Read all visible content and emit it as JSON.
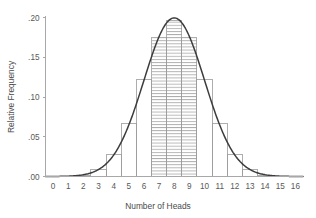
{
  "chart_data": {
    "type": "bar",
    "title": "",
    "subtitle": "",
    "xlabel": "Number of Heads",
    "ylabel": "Relative Frequency",
    "categories": [
      0,
      1,
      2,
      3,
      4,
      5,
      6,
      7,
      8,
      9,
      10,
      11,
      12,
      13,
      14,
      15,
      16
    ],
    "values": [
      0.0,
      0.0002,
      0.0018,
      0.0085,
      0.0278,
      0.0667,
      0.1222,
      0.1746,
      0.1964,
      0.1746,
      0.1222,
      0.0667,
      0.0278,
      0.0085,
      0.0018,
      0.0002,
      0.0
    ],
    "xlim": [
      -0.5,
      16.5
    ],
    "ylim": [
      0,
      0.2
    ],
    "xticks": [
      "0",
      "1",
      "2",
      "3",
      "4",
      "5",
      "6",
      "7",
      "8",
      "9",
      "10",
      "11",
      "12",
      "13",
      "14",
      "15",
      "16"
    ],
    "yticks": [
      ".00",
      ".05",
      ".10",
      ".15",
      ".20"
    ],
    "ytick_values": [
      0.0,
      0.05,
      0.1,
      0.15,
      0.2
    ],
    "grid": false,
    "legend": "none",
    "series": [
      {
        "name": "Relative frequency histogram",
        "type": "bar",
        "values": [
          0.0,
          0.0002,
          0.0018,
          0.0085,
          0.0278,
          0.0667,
          0.1222,
          0.1746,
          0.1964,
          0.1746,
          0.1222,
          0.0667,
          0.0278,
          0.0085,
          0.0018,
          0.0002,
          0.0
        ]
      },
      {
        "name": "Normal approximation curve",
        "type": "line",
        "mean": 8.0,
        "sd": 2.0,
        "peak": 0.1995
      }
    ],
    "highlighted_bars": [
      7,
      8,
      9
    ],
    "highlight_style": "horizontal-hatch",
    "annotations": []
  },
  "colors": {
    "background": "#ffffff",
    "axis": "#a8a8a8",
    "bar_outline": "#9a9a9a",
    "curve": "#3c3c3c",
    "text": "#595959",
    "hatch": "#8e8e8e"
  }
}
